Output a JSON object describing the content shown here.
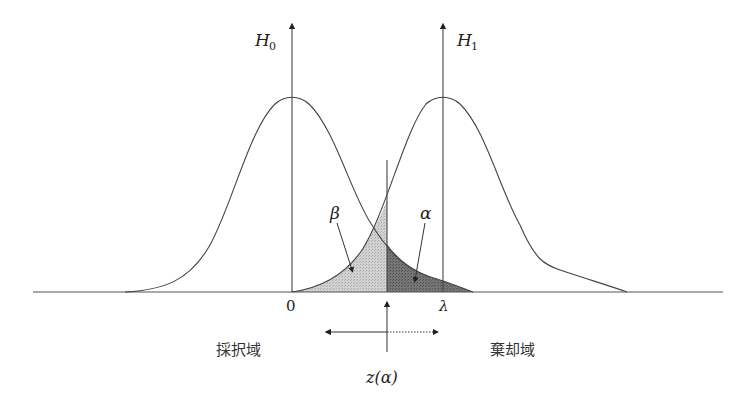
{
  "diagram": {
    "hypotheses": {
      "h0": "H",
      "h0_sub": "0",
      "h1": "H",
      "h1_sub": "1"
    },
    "areas": {
      "beta": "β",
      "alpha": "α"
    },
    "axis_ticks": {
      "zero": "0",
      "lambda": "λ"
    },
    "critical_value": "z(α)",
    "regions": {
      "accept": "採択域",
      "reject": "棄却域"
    },
    "colors": {
      "line": "#444444",
      "beta_fill": "#c8c8c8",
      "alpha_fill": "#6e6e6e",
      "background": "#ffffff"
    }
  }
}
